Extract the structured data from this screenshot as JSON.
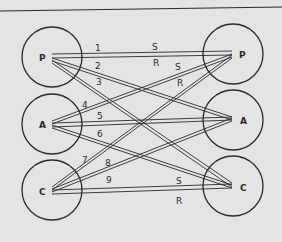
{
  "diagram": {
    "left_nodes": [
      {
        "id": "P",
        "label": "P"
      },
      {
        "id": "A",
        "label": "A"
      },
      {
        "id": "C",
        "label": "C"
      }
    ],
    "right_nodes": [
      {
        "id": "P",
        "label": "P"
      },
      {
        "id": "A",
        "label": "A"
      },
      {
        "id": "C",
        "label": "C"
      }
    ],
    "edge_numbers": [
      "1",
      "2",
      "3",
      "4",
      "5",
      "6",
      "7",
      "8",
      "9"
    ],
    "channel_labels": {
      "top_s": "S",
      "top_r": "R",
      "mid_s": "S",
      "mid_r": "R",
      "bottom_s": "S",
      "bottom_r": "R"
    },
    "colors": {
      "background": "#e4e4e2",
      "ink": "#2a2a2a"
    }
  }
}
